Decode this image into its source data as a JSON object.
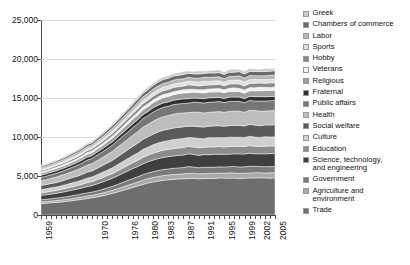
{
  "chart_data": {
    "type": "area",
    "title": "",
    "xlabel": "",
    "ylabel": "",
    "ylim": [
      0,
      25000
    ],
    "yticks": [
      "0",
      "5,000",
      "10,000",
      "15,000",
      "20,000",
      "25,000"
    ],
    "ytick_values": [
      0,
      5000,
      10000,
      15000,
      20000,
      25000
    ],
    "grid": true,
    "legend_position": "right",
    "stacked": true,
    "x_tick_labels": [
      "1959",
      "1970",
      "1976",
      "1980",
      "1983",
      "1987",
      "1991",
      "1995",
      "1999",
      "2002",
      "2005"
    ],
    "x_tick_years": [
      1959,
      1970,
      1976,
      1980,
      1983,
      1987,
      1991,
      1995,
      1999,
      2002,
      2005
    ],
    "x": [
      1959,
      1960,
      1961,
      1962,
      1963,
      1964,
      1965,
      1966,
      1967,
      1968,
      1969,
      1970,
      1971,
      1972,
      1973,
      1974,
      1975,
      1976,
      1977,
      1978,
      1979,
      1980,
      1981,
      1982,
      1983,
      1984,
      1985,
      1986,
      1987,
      1988,
      1989,
      1990,
      1991,
      1992,
      1993,
      1994,
      1995,
      1996,
      1997,
      1998,
      1999,
      2000,
      2001,
      2002,
      2003,
      2004,
      2005
    ],
    "series": [
      {
        "name": "Trade",
        "color": "#6e6e6e",
        "values": [
          1450,
          1500,
          1560,
          1620,
          1680,
          1750,
          1830,
          1910,
          2000,
          2100,
          2210,
          2320,
          2450,
          2600,
          2760,
          2940,
          3130,
          3330,
          3530,
          3730,
          3920,
          4090,
          4230,
          4350,
          4450,
          4520,
          4570,
          4610,
          4640,
          4660,
          4670,
          4680,
          4690,
          4700,
          4705,
          4710,
          4715,
          4720,
          4725,
          4730,
          4735,
          4740,
          4745,
          4750,
          4755,
          4760,
          4765
        ]
      },
      {
        "name": "Agriculture and\nenvironment",
        "color": "#a9a9a9",
        "values": [
          220,
          228,
          236,
          245,
          254,
          264,
          275,
          287,
          300,
          314,
          329,
          345,
          363,
          382,
          403,
          425,
          448,
          472,
          496,
          520,
          543,
          564,
          582,
          597,
          609,
          618,
          624,
          629,
          632,
          634,
          636,
          637,
          638,
          639,
          640,
          641,
          642,
          643,
          644,
          645,
          646,
          647,
          648,
          649,
          650,
          651,
          652
        ]
      },
      {
        "name": "Government",
        "color": "#7a7a7a",
        "values": [
          280,
          290,
          301,
          313,
          325,
          338,
          352,
          367,
          383,
          401,
          420,
          441,
          464,
          489,
          515,
          543,
          572,
          602,
          632,
          662,
          691,
          717,
          740,
          759,
          774,
          785,
          793,
          798,
          802,
          805,
          807,
          808,
          809,
          810,
          811,
          812,
          813,
          814,
          815,
          816,
          817,
          818,
          819,
          820,
          821,
          822,
          823
        ]
      },
      {
        "name": "Science, technology,\nand engineering",
        "color": "#3f3f3f",
        "values": [
          560,
          580,
          602,
          625,
          650,
          677,
          706,
          737,
          770,
          806,
          845,
          887,
          933,
          982,
          1035,
          1091,
          1150,
          1210,
          1270,
          1330,
          1388,
          1440,
          1486,
          1524,
          1555,
          1577,
          1592,
          1603,
          1610,
          1615,
          1618,
          1620,
          1622,
          1624,
          1626,
          1628,
          1630,
          1632,
          1634,
          1636,
          1638,
          1640,
          1642,
          1644,
          1646,
          1648,
          1650
        ]
      },
      {
        "name": "Education",
        "color": "#8c8c8c",
        "values": [
          330,
          342,
          355,
          369,
          384,
          400,
          417,
          436,
          456,
          478,
          501,
          526,
          553,
          582,
          613,
          646,
          681,
          717,
          753,
          788,
          822,
          853,
          880,
          902,
          920,
          933,
          942,
          948,
          952,
          955,
          957,
          958,
          959,
          960,
          961,
          962,
          963,
          964,
          965,
          966,
          967,
          968,
          969,
          970,
          971,
          972,
          973
        ]
      },
      {
        "name": "Culture",
        "color": "#cfcfcf",
        "values": [
          400,
          415,
          431,
          448,
          466,
          486,
          507,
          530,
          554,
          581,
          609,
          639,
          672,
          707,
          745,
          785,
          828,
          871,
          915,
          958,
          999,
          1036,
          1069,
          1096,
          1118,
          1134,
          1145,
          1152,
          1157,
          1160,
          1162,
          1164,
          1165,
          1166,
          1167,
          1168,
          1169,
          1170,
          1171,
          1172,
          1173,
          1174,
          1175,
          1176,
          1177,
          1178,
          1179
        ]
      },
      {
        "name": "Social welfare",
        "color": "#5a5a5a",
        "values": [
          520,
          539,
          560,
          582,
          605,
          631,
          658,
          688,
          720,
          754,
          791,
          830,
          873,
          918,
          967,
          1019,
          1075,
          1132,
          1188,
          1244,
          1297,
          1346,
          1388,
          1423,
          1451,
          1472,
          1487,
          1496,
          1503,
          1507,
          1510,
          1512,
          1513,
          1514,
          1515,
          1516,
          1517,
          1518,
          1519,
          1520,
          1521,
          1522,
          1523,
          1524,
          1525,
          1526,
          1527
        ]
      },
      {
        "name": "Health",
        "color": "#bdbdbd",
        "values": [
          620,
          643,
          667,
          694,
          722,
          752,
          785,
          820,
          858,
          899,
          943,
          990,
          1041,
          1095,
          1153,
          1215,
          1282,
          1349,
          1417,
          1483,
          1547,
          1605,
          1655,
          1697,
          1730,
          1755,
          1773,
          1784,
          1792,
          1797,
          1800,
          1802,
          1804,
          1806,
          1808,
          1810,
          1812,
          1814,
          1816,
          1818,
          1820,
          1822,
          1824,
          1826,
          1828,
          1830,
          1832
        ]
      },
      {
        "name": "Public affairs",
        "color": "#767676",
        "values": [
          430,
          446,
          463,
          481,
          501,
          522,
          545,
          569,
          596,
          624,
          654,
          687,
          722,
          760,
          800,
          843,
          889,
          936,
          983,
          1029,
          1073,
          1113,
          1148,
          1177,
          1200,
          1217,
          1229,
          1237,
          1242,
          1246,
          1248,
          1250,
          1251,
          1252,
          1253,
          1254,
          1255,
          1256,
          1257,
          1258,
          1259,
          1260,
          1261,
          1262,
          1263,
          1264,
          1265
        ]
      },
      {
        "name": "Fraternal",
        "color": "#2f2f2f",
        "values": [
          300,
          305,
          310,
          316,
          322,
          329,
          336,
          344,
          353,
          362,
          372,
          383,
          395,
          407,
          420,
          434,
          449,
          464,
          479,
          494,
          508,
          520,
          531,
          540,
          547,
          552,
          556,
          558,
          560,
          561,
          562,
          563,
          564,
          565,
          566,
          567,
          568,
          569,
          570,
          571,
          572,
          573,
          574,
          575,
          576,
          577,
          578
        ]
      },
      {
        "name": "Religious",
        "color": "#9e9e9e",
        "values": [
          250,
          259,
          269,
          280,
          291,
          303,
          316,
          330,
          345,
          362,
          379,
          398,
          419,
          441,
          464,
          489,
          516,
          543,
          570,
          597,
          622,
          646,
          666,
          683,
          696,
          706,
          713,
          718,
          721,
          723,
          725,
          726,
          727,
          728,
          729,
          730,
          731,
          732,
          733,
          734,
          735,
          736,
          737,
          738,
          739,
          740,
          741
        ]
      },
      {
        "name": "Veterans",
        "color": "#f2f2f2",
        "values": [
          140,
          145,
          151,
          157,
          163,
          170,
          177,
          185,
          193,
          203,
          213,
          223,
          235,
          247,
          260,
          274,
          289,
          304,
          319,
          334,
          348,
          361,
          373,
          382,
          389,
          395,
          399,
          402,
          404,
          405,
          406,
          407,
          408,
          409,
          410,
          411,
          412,
          413,
          414,
          415,
          416,
          417,
          418,
          419,
          420,
          421,
          422
        ]
      },
      {
        "name": "Hobby",
        "color": "#888888",
        "values": [
          180,
          187,
          194,
          202,
          210,
          219,
          228,
          238,
          249,
          261,
          274,
          288,
          303,
          318,
          335,
          354,
          373,
          392,
          412,
          431,
          449,
          466,
          481,
          493,
          503,
          510,
          515,
          519,
          521,
          523,
          524,
          525,
          526,
          527,
          528,
          529,
          530,
          531,
          532,
          533,
          534,
          535,
          536,
          537,
          538,
          539,
          540
        ]
      },
      {
        "name": "Sports",
        "color": "#e0e0e0",
        "values": [
          160,
          166,
          173,
          180,
          187,
          195,
          204,
          213,
          223,
          234,
          245,
          258,
          271,
          285,
          300,
          317,
          334,
          352,
          369,
          387,
          403,
          418,
          431,
          442,
          451,
          457,
          462,
          465,
          467,
          469,
          470,
          471,
          472,
          473,
          474,
          475,
          476,
          477,
          478,
          479,
          480,
          481,
          482,
          483,
          484,
          485,
          486
        ]
      },
      {
        "name": "Labor",
        "color": "#b5b5b5",
        "values": [
          210,
          216,
          222,
          229,
          236,
          244,
          252,
          261,
          271,
          281,
          292,
          304,
          317,
          330,
          345,
          360,
          377,
          393,
          410,
          426,
          441,
          455,
          466,
          475,
          482,
          487,
          490,
          492,
          494,
          495,
          496,
          497,
          498,
          499,
          500,
          501,
          502,
          503,
          504,
          505,
          506,
          507,
          508,
          509,
          510,
          511,
          512
        ]
      },
      {
        "name": "Chambers of commerce",
        "color": "#696969",
        "values": [
          190,
          196,
          203,
          210,
          218,
          226,
          235,
          245,
          255,
          267,
          279,
          292,
          306,
          321,
          337,
          355,
          374,
          393,
          412,
          431,
          449,
          465,
          479,
          491,
          500,
          507,
          512,
          515,
          517,
          519,
          520,
          521,
          522,
          523,
          524,
          525,
          526,
          527,
          528,
          529,
          530,
          531,
          532,
          533,
          534,
          535,
          536
        ]
      },
      {
        "name": "Greek",
        "color": "#cacaca",
        "values": [
          120,
          124,
          128,
          133,
          138,
          143,
          149,
          155,
          162,
          169,
          177,
          185,
          194,
          204,
          214,
          225,
          237,
          249,
          261,
          273,
          284,
          294,
          303,
          310,
          316,
          320,
          323,
          325,
          327,
          328,
          329,
          330,
          331,
          332,
          333,
          334,
          335,
          336,
          337,
          338,
          339,
          340,
          341,
          342,
          343,
          344,
          345
        ]
      }
    ]
  },
  "legend": {
    "items": [
      {
        "label": "Greek",
        "color": "#cacaca"
      },
      {
        "label": "Chambers of commerce",
        "color": "#696969"
      },
      {
        "label": "Labor",
        "color": "#b5b5b5"
      },
      {
        "label": "Sports",
        "color": "#e0e0e0"
      },
      {
        "label": "Hobby",
        "color": "#888888"
      },
      {
        "label": "Veterans",
        "color": "#f2f2f2"
      },
      {
        "label": "Religious",
        "color": "#9e9e9e"
      },
      {
        "label": "Fraternal",
        "color": "#2f2f2f"
      },
      {
        "label": "Public affairs",
        "color": "#767676"
      },
      {
        "label": "Health",
        "color": "#bdbdbd"
      },
      {
        "label": "Social welfare",
        "color": "#5a5a5a"
      },
      {
        "label": "Culture",
        "color": "#cfcfcf"
      },
      {
        "label": "Education",
        "color": "#8c8c8c"
      },
      {
        "label": "Science, technology,\nand engineering",
        "color": "#3f3f3f"
      },
      {
        "label": "Government",
        "color": "#7a7a7a"
      },
      {
        "label": "Agriculture and\nenvironment",
        "color": "#a9a9a9"
      },
      {
        "label": "Trade",
        "color": "#6e6e6e"
      }
    ]
  },
  "axes": {
    "y_tick_labels": [
      "25,000",
      "20,000",
      "15,000",
      "10,000",
      "5,000",
      "0"
    ],
    "x_tick_labels": [
      "1959",
      "1970",
      "1976",
      "1980",
      "1983",
      "1987",
      "1991",
      "1995",
      "1999",
      "2002",
      "2005"
    ]
  }
}
